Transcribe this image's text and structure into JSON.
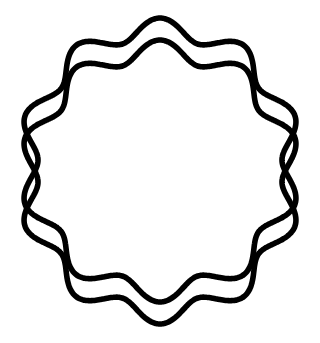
{
  "canvas": {
    "width": 320,
    "height": 343,
    "background_color": "#ffffff"
  },
  "figure": {
    "name": "overlapping-scalloped-circles",
    "stroke_color": "#000000",
    "stroke_width": 5.6,
    "shape_count": 2
  },
  "shapes": [
    {
      "label": "upper-scalloped-circle",
      "center_x": 160,
      "center_y": 160,
      "mean_radius": 132,
      "wave_amplitude": 10,
      "lobes": 10,
      "phase_degrees": -90
    },
    {
      "label": "lower-scalloped-circle",
      "center_x": 160,
      "center_y": 182,
      "mean_radius": 132,
      "wave_amplitude": 10,
      "lobes": 10,
      "phase_degrees": -90
    }
  ],
  "chart_data": {
    "type": "line",
    "title": "",
    "xlabel": "",
    "ylabel": "",
    "grid": false,
    "legend": "none",
    "xlim": [
      0,
      320
    ],
    "ylim": [
      0,
      343
    ],
    "series": [
      {
        "name": "upper-scalloped-circle",
        "kind": "polar-sinusoid-closed",
        "center": [
          160,
          160
        ],
        "mean_radius": 132,
        "amplitude": 10,
        "frequency": 10,
        "phase_degrees": -90,
        "stroke": "#000000",
        "stroke_width": 5.6
      },
      {
        "name": "lower-scalloped-circle",
        "kind": "polar-sinusoid-closed",
        "center": [
          160,
          182
        ],
        "mean_radius": 132,
        "amplitude": 10,
        "frequency": 10,
        "phase_degrees": -90,
        "stroke": "#000000",
        "stroke_width": 5.6
      }
    ]
  }
}
